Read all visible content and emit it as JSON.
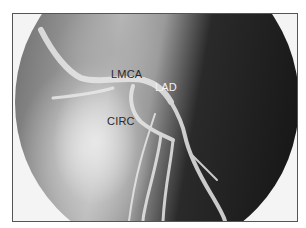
{
  "figure": {
    "type": "coronary angiogram",
    "labels": {
      "lmca": "LMCA",
      "lad": "LAD",
      "circ": "CIRC"
    }
  }
}
